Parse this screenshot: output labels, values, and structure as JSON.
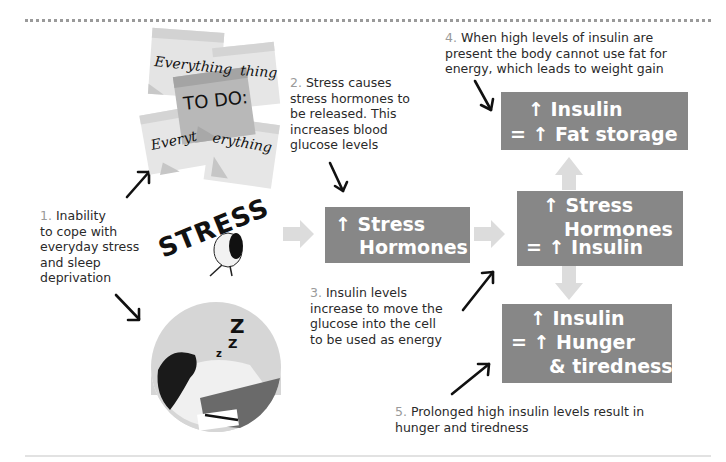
{
  "colors": {
    "box_fill": "#878787",
    "box_text": "#ffffff",
    "flow_arrow": "#dcdcdc",
    "step_number": "#9a9a9a",
    "pointer_arrow": "#111111"
  },
  "steps": [
    {
      "num": "1.",
      "lines": [
        "Inability",
        "to cope with",
        "everyday stress",
        "and sleep",
        "deprivation"
      ]
    },
    {
      "num": "2.",
      "lines": [
        "Stress causes",
        "stress hormones to",
        "be released. This",
        "increases blood",
        "glucose levels"
      ]
    },
    {
      "num": "3.",
      "lines": [
        "Insulin levels",
        "increase to move the",
        "glucose into the cell",
        "to be used as energy"
      ]
    },
    {
      "num": "4.",
      "lines": [
        "When high levels of insulin are",
        "present the body cannot use fat for",
        "energy, which leads to weight gain"
      ]
    },
    {
      "num": "5.",
      "lines": [
        "Prolonged high insulin levels result in",
        "hunger and tiredness"
      ]
    }
  ],
  "boxes": {
    "stress_hormones": {
      "lines": [
        "↑ Stress",
        "Hormones"
      ]
    },
    "fat_storage": {
      "lines": [
        "↑ Insulin",
        "= ↑ Fat storage"
      ]
    },
    "stress_insulin": {
      "lines": [
        "↑ Stress",
        "Hormones",
        "= ↑ Insulin"
      ]
    },
    "hunger": {
      "lines": [
        "↑ Insulin",
        "= ↑ Hunger",
        "& tiredness"
      ]
    }
  },
  "illustrations": {
    "sticky_notes": {
      "notes": [
        "Everything",
        "thing",
        "TO DO:",
        "Everyt",
        "erything"
      ]
    },
    "stress_figure": {
      "word": "STRESS"
    },
    "sleeping_person": {
      "zzz": [
        "Z",
        "Z",
        "z"
      ]
    }
  }
}
